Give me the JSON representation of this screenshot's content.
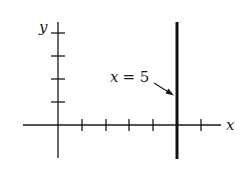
{
  "diagram": {
    "type": "coordinate-plane",
    "axes": {
      "x_label": "x",
      "y_label": "y",
      "x_ticks": [
        1,
        2,
        3,
        4,
        5,
        6
      ],
      "y_ticks": [
        1,
        2,
        3,
        4
      ]
    },
    "line": {
      "equation_label": "x = 5",
      "label_var": "x",
      "label_eq": "= 5",
      "orientation": "vertical",
      "x_value": 5
    },
    "colors": {
      "ink": "#1a1a1a",
      "background": "#ffffff"
    }
  }
}
